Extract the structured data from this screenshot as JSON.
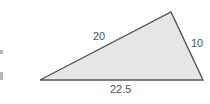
{
  "figure": {
    "shape": "triangle",
    "vertices": [
      [
        40,
        80
      ],
      [
        171,
        12
      ],
      [
        203,
        80
      ]
    ],
    "fill_color": "#e6e6e6",
    "stroke_color": "#555555",
    "side_labels": {
      "left_side": "20",
      "right_side": "10",
      "base": "22.5"
    }
  }
}
